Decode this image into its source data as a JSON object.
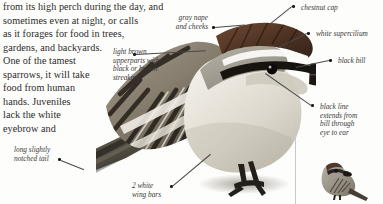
{
  "page": {
    "width": 383,
    "height": 204,
    "background": "#fdfdfb",
    "ink": "#2b2b2b"
  },
  "body_text": {
    "lines": [
      "from its high perch during the day, and",
      "sometimes even at night, or calls",
      "as it forages for food in trees,",
      "gardens, and backyards.",
      "One of the tamest",
      "sparrows, it will take",
      "food from human",
      "hands. Juveniles",
      "lack the white",
      "eyebrow and"
    ]
  },
  "annotations": [
    {
      "name": "gray-nape-and-cheeks",
      "lines": [
        "gray nape",
        "and cheeks"
      ],
      "align": "right"
    },
    {
      "name": "light-brown-upperparts",
      "lines": [
        "light brown",
        "upperparts with",
        "black or brown",
        "streaking"
      ],
      "align": "left"
    },
    {
      "name": "long-slightly-notched-tail",
      "lines": [
        "long slightly",
        "notched tail"
      ],
      "align": "left"
    },
    {
      "name": "two-white-wing-bars",
      "lines": [
        "2 white",
        "wing bars"
      ],
      "align": "left"
    },
    {
      "name": "chestnut-cap",
      "lines": [
        "chestnut cap"
      ],
      "align": "left"
    },
    {
      "name": "white-supercilium",
      "lines": [
        "white supercilium"
      ],
      "align": "left"
    },
    {
      "name": "black-bill",
      "lines": [
        "black bill"
      ],
      "align": "left"
    },
    {
      "name": "black-line-through-eye",
      "lines": [
        "black line",
        "extends from",
        "bill through",
        "eye to ear"
      ],
      "align": "left"
    }
  ],
  "artwork": {
    "main_bird": "chipping-sparrow-closeup-illustration",
    "thumbnail_bird": "chipping-sparrow-full-body-thumbnail"
  }
}
